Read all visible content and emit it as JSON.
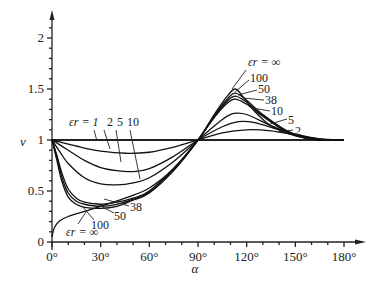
{
  "chart_data": {
    "type": "line",
    "title": "",
    "xlabel": "α",
    "ylabel": "v",
    "xlim": [
      0,
      180
    ],
    "ylim": [
      0,
      2.2
    ],
    "grid": false,
    "x_ticks": [
      0,
      30,
      60,
      90,
      120,
      150,
      180
    ],
    "x_tick_labels": [
      "0°",
      "30°",
      "60°",
      "90°",
      "120°",
      "150°",
      "180°"
    ],
    "y_ticks": [
      0,
      0.5,
      1,
      1.5,
      2
    ],
    "y_tick_labels": [
      "0",
      "0.5",
      "1",
      "1.5",
      "2"
    ],
    "legend": "inline labels",
    "series": [
      {
        "name": "εr = 1",
        "label": "1",
        "x": [
          0,
          180
        ],
        "y": [
          1,
          1
        ]
      },
      {
        "name": "εr = 2",
        "label": "2",
        "x": [
          0,
          10,
          20,
          30,
          45,
          60,
          75,
          90,
          105,
          120,
          135,
          150,
          165,
          180
        ],
        "y": [
          1,
          0.96,
          0.92,
          0.89,
          0.87,
          0.88,
          0.93,
          1.0,
          1.07,
          1.1,
          1.09,
          1.05,
          1.01,
          1.0
        ]
      },
      {
        "name": "εr = 5",
        "label": "5",
        "x": [
          0,
          10,
          20,
          30,
          40,
          50,
          60,
          75,
          90,
          105,
          115,
          125,
          140,
          155,
          170,
          180
        ],
        "y": [
          1,
          0.9,
          0.8,
          0.73,
          0.7,
          0.69,
          0.72,
          0.84,
          1.0,
          1.13,
          1.18,
          1.17,
          1.1,
          1.04,
          1.0,
          1.0
        ]
      },
      {
        "name": "εr = 10",
        "label": "10",
        "x": [
          0,
          5,
          10,
          20,
          30,
          40,
          50,
          60,
          75,
          90,
          105,
          112,
          120,
          135,
          150,
          165,
          180
        ],
        "y": [
          1,
          0.88,
          0.77,
          0.63,
          0.57,
          0.56,
          0.58,
          0.63,
          0.79,
          1.0,
          1.2,
          1.26,
          1.25,
          1.14,
          1.05,
          1.0,
          1.0
        ]
      },
      {
        "name": "εr = 38",
        "label": "38",
        "x": [
          0,
          3,
          6,
          10,
          15,
          20,
          30,
          40,
          50,
          60,
          75,
          90,
          100,
          108,
          113,
          120,
          130,
          145,
          160,
          180
        ],
        "y": [
          1,
          0.85,
          0.68,
          0.52,
          0.43,
          0.39,
          0.37,
          0.39,
          0.43,
          0.5,
          0.72,
          1.0,
          1.22,
          1.36,
          1.4,
          1.35,
          1.23,
          1.08,
          1.01,
          1.0
        ]
      },
      {
        "name": "εr = 50",
        "label": "50",
        "x": [
          0,
          3,
          6,
          10,
          15,
          20,
          30,
          40,
          50,
          60,
          75,
          90,
          100,
          108,
          113,
          120,
          130,
          145,
          160,
          180
        ],
        "y": [
          1,
          0.83,
          0.64,
          0.48,
          0.4,
          0.37,
          0.35,
          0.37,
          0.42,
          0.49,
          0.71,
          1.0,
          1.23,
          1.38,
          1.43,
          1.37,
          1.24,
          1.08,
          1.01,
          1.0
        ]
      },
      {
        "name": "εr = 100",
        "label": "100",
        "x": [
          0,
          3,
          6,
          10,
          15,
          20,
          30,
          40,
          50,
          60,
          75,
          90,
          100,
          108,
          113,
          120,
          130,
          145,
          160,
          180
        ],
        "y": [
          1,
          0.8,
          0.6,
          0.44,
          0.37,
          0.34,
          0.33,
          0.35,
          0.41,
          0.48,
          0.7,
          1.0,
          1.24,
          1.4,
          1.46,
          1.39,
          1.25,
          1.09,
          1.01,
          1.0
        ]
      },
      {
        "name": "εr = ∞",
        "label": "∞",
        "x": [
          0,
          1,
          3,
          6,
          10,
          20,
          30,
          45,
          60,
          75,
          90,
          100,
          108,
          113,
          118,
          125,
          135,
          150,
          165,
          180
        ],
        "y": [
          0.05,
          0.12,
          0.18,
          0.22,
          0.25,
          0.3,
          0.35,
          0.43,
          0.53,
          0.72,
          1.0,
          1.25,
          1.43,
          1.5,
          1.42,
          1.28,
          1.14,
          1.04,
          1.0,
          1.0
        ]
      }
    ],
    "annotations": [
      "εr = 1 2 5 10",
      "εr = ∞",
      "100",
      "50",
      "38",
      "10",
      "5",
      "2"
    ]
  },
  "labels": {
    "er_prefix_top": "εr = 1",
    "er2": "2",
    "er5": "5",
    "er10": "10",
    "er_inf_bottom": "εr = ∞",
    "b100": "100",
    "b50": "50",
    "b38": "38",
    "er_inf_top": "εr = ∞",
    "t100": "100",
    "t50": "50",
    "t38": "38",
    "t10": "10",
    "t5": "5",
    "t2": "2"
  }
}
